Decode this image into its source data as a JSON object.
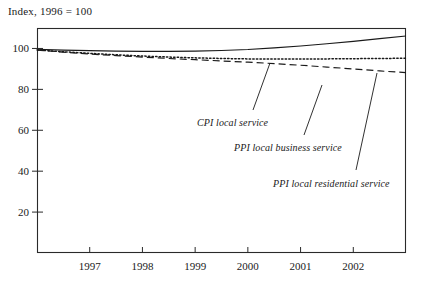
{
  "chart_data": {
    "type": "line",
    "title": "Index, 1996 = 100",
    "xlabel": "",
    "ylabel": "Index, 1996 = 100",
    "xlim": [
      1996.0,
      2003.0
    ],
    "ylim": [
      0,
      110
    ],
    "grid": false,
    "legend_position": "inline-annotations",
    "yticks": [
      20,
      40,
      60,
      80,
      100
    ],
    "ytick_labels": [
      "20",
      "40",
      "60",
      "80",
      "100"
    ],
    "xticks": [
      1997,
      1998,
      1999,
      2000,
      2001,
      2002
    ],
    "xtick_labels": [
      "1997",
      "1998",
      "1999",
      "2000",
      "2001",
      "2002"
    ],
    "x": [
      1996.0,
      1996.5,
      1997.0,
      1997.5,
      1998.0,
      1998.5,
      1999.0,
      1999.5,
      2000.0,
      2000.5,
      2001.0,
      2001.5,
      2002.0,
      2002.5,
      2003.0
    ],
    "series": [
      {
        "name": "CPI local service",
        "style": "solid",
        "color": "#1a1a1a",
        "values": [
          99.6,
          99.2,
          98.9,
          98.7,
          98.6,
          98.6,
          98.7,
          99.0,
          99.5,
          100.3,
          101.2,
          102.3,
          103.5,
          104.8,
          106.1
        ]
      },
      {
        "name": "PPI local residential service",
        "style": "dotted",
        "color": "#1a1a1a",
        "values": [
          99.3,
          98.4,
          97.6,
          96.9,
          96.3,
          95.8,
          95.4,
          95.1,
          94.9,
          94.8,
          94.8,
          94.9,
          95.0,
          95.1,
          95.2
        ]
      },
      {
        "name": "PPI local business service",
        "style": "dashed",
        "color": "#1a1a1a",
        "values": [
          99.2,
          98.2,
          97.3,
          96.5,
          95.8,
          95.1,
          94.5,
          93.9,
          93.3,
          92.6,
          91.8,
          90.9,
          90.0,
          89.0,
          88.2
        ]
      }
    ],
    "annotations": [
      {
        "label": "CPI local service",
        "text_x": 197,
        "text_y": 117,
        "leader_from_x": 253,
        "leader_from_y": 110,
        "leader_to_x": 270,
        "leader_to_y": 63
      },
      {
        "label": "PPI local business service",
        "text_x": 234,
        "text_y": 142,
        "leader_from_x": 304,
        "leader_from_y": 135,
        "leader_to_x": 322,
        "leader_to_y": 85
      },
      {
        "label": "PPI local residential service",
        "text_x": 273,
        "text_y": 178,
        "leader_from_x": 356,
        "leader_from_y": 170,
        "leader_to_x": 377,
        "leader_to_y": 73
      }
    ]
  },
  "plot_area": {
    "left": 37,
    "right": 406,
    "top": 28,
    "bottom": 253
  },
  "colors": {
    "ink": "#1a1a1a",
    "background": "#ffffff",
    "axis": "#2a2a2a"
  }
}
